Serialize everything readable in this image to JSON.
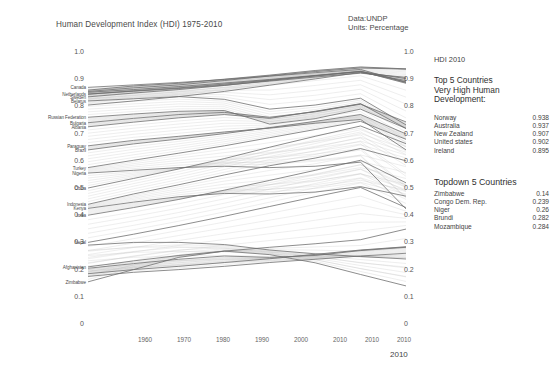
{
  "header": {
    "title": "Human Development Index (HDI) 1975-2010",
    "source_line1": "Data:UNDP",
    "source_line2": "Units: Percentage"
  },
  "legend": {
    "heading": "HDI 2010",
    "top_title_line1": "Top 5 Countries",
    "top_title_line2": "Very High Human",
    "top_title_line3": "Development:",
    "top_rows": [
      {
        "name": "Norway",
        "value": "0.938"
      },
      {
        "name": "Australia",
        "value": "0.937"
      },
      {
        "name": "New Zealand",
        "value": "0.907"
      },
      {
        "name": "United states",
        "value": "0.902"
      },
      {
        "name": "Ireland",
        "value": "0.895"
      }
    ],
    "bottom_title": "Topdown 5 Countries",
    "bottom_rows": [
      {
        "name": "Zimbabwe",
        "value": "0.14"
      },
      {
        "name": "Congo  Dem. Rep.",
        "value": "0.239"
      },
      {
        "name": "Niger",
        "value": "0.26"
      },
      {
        "name": "Brundi",
        "value": "0.282"
      },
      {
        "name": "Mozambique",
        "value": "0.284"
      }
    ]
  },
  "chart_data": {
    "type": "line",
    "title": "Human Development Index (HDI) 1975-2010",
    "xlabel": "",
    "ylabel": "",
    "ylim": [
      0,
      1.0
    ],
    "grid": false,
    "legend_position": "right",
    "y_ticks_left": [
      "1.0",
      "0.9",
      "0.8",
      "0.7",
      "0.6",
      "0.5",
      "0.4",
      "0.3",
      "0.2",
      "0.1",
      "0"
    ],
    "y_ticks_right": [
      "1.0",
      "0.9",
      "0.8",
      "0.7",
      "0.6",
      "0.5",
      "0.4",
      "0.3",
      "0.2",
      "0.1",
      "0"
    ],
    "x_ticks": [
      "1960",
      "1970",
      "1980",
      "1990",
      "2000",
      "2010",
      "2010",
      "2010"
    ],
    "x_axis_note": "2010",
    "x": [
      1975,
      1980,
      1985,
      1990,
      1995,
      2000,
      2005,
      2010
    ],
    "left_axis_labels": [
      {
        "name": "Canada",
        "value": 0.87
      },
      {
        "name": "Netherlands",
        "value": 0.845
      },
      {
        "name": "Sweden",
        "value": 0.835
      },
      {
        "name": "Belarus",
        "value": 0.82
      },
      {
        "name": "Russian Federation",
        "value": 0.76
      },
      {
        "name": "Bulgaria",
        "value": 0.74
      },
      {
        "name": "Albania",
        "value": 0.725
      },
      {
        "name": "Paraguay",
        "value": 0.655
      },
      {
        "name": "Brazil",
        "value": 0.64
      },
      {
        "name": "Turkey",
        "value": 0.575
      },
      {
        "name": "Nigeria",
        "value": 0.555
      },
      {
        "name": "China",
        "value": 0.5
      },
      {
        "name": "Indonesia",
        "value": 0.44
      },
      {
        "name": "Kenya",
        "value": 0.425
      },
      {
        "name": "India",
        "value": 0.4
      },
      {
        "name": "Nepal",
        "value": 0.3
      },
      {
        "name": "Afghanistan",
        "value": 0.21
      },
      {
        "name": "Zimbabwe",
        "value": 0.155
      }
    ],
    "series": [
      {
        "name": "Norway",
        "values": [
          0.86,
          0.875,
          0.885,
          0.9,
          0.915,
          0.932,
          0.945,
          0.938
        ]
      },
      {
        "name": "Australia",
        "values": [
          0.855,
          0.868,
          0.879,
          0.895,
          0.912,
          0.928,
          0.941,
          0.937
        ]
      },
      {
        "name": "New Zealand",
        "values": [
          0.845,
          0.856,
          0.866,
          0.878,
          0.893,
          0.908,
          0.922,
          0.907
        ]
      },
      {
        "name": "United states",
        "values": [
          0.852,
          0.862,
          0.873,
          0.886,
          0.899,
          0.914,
          0.928,
          0.902
        ]
      },
      {
        "name": "Ireland",
        "values": [
          0.805,
          0.82,
          0.836,
          0.855,
          0.878,
          0.901,
          0.925,
          0.895
        ]
      },
      {
        "name": "Canada",
        "values": [
          0.87,
          0.879,
          0.888,
          0.899,
          0.911,
          0.924,
          0.936,
          0.888
        ]
      },
      {
        "name": "Netherlands",
        "values": [
          0.845,
          0.857,
          0.868,
          0.882,
          0.897,
          0.912,
          0.928,
          0.89
        ]
      },
      {
        "name": "Sweden",
        "values": [
          0.835,
          0.849,
          0.862,
          0.877,
          0.895,
          0.913,
          0.929,
          0.885
        ]
      },
      {
        "name": "Belarus",
        "values": [
          0.82,
          0.828,
          0.836,
          0.826,
          0.79,
          0.805,
          0.83,
          0.732
        ]
      },
      {
        "name": "Russian Federation",
        "values": [
          0.76,
          0.772,
          0.782,
          0.785,
          0.735,
          0.755,
          0.79,
          0.719
        ]
      },
      {
        "name": "Bulgaria",
        "values": [
          0.74,
          0.756,
          0.77,
          0.778,
          0.76,
          0.78,
          0.808,
          0.743
        ]
      },
      {
        "name": "Albania",
        "values": [
          0.725,
          0.742,
          0.758,
          0.77,
          0.756,
          0.782,
          0.81,
          0.719
        ]
      },
      {
        "name": "Paraguay",
        "values": [
          0.655,
          0.675,
          0.69,
          0.706,
          0.72,
          0.738,
          0.752,
          0.64
        ]
      },
      {
        "name": "Brazil",
        "values": [
          0.64,
          0.662,
          0.68,
          0.7,
          0.722,
          0.745,
          0.77,
          0.699
        ]
      },
      {
        "name": "Turkey",
        "values": [
          0.575,
          0.602,
          0.628,
          0.655,
          0.685,
          0.715,
          0.745,
          0.679
        ]
      },
      {
        "name": "Nigeria",
        "values": [
          0.555,
          0.565,
          0.575,
          0.58,
          0.575,
          0.58,
          0.595,
          0.423
        ]
      },
      {
        "name": "China",
        "values": [
          0.5,
          0.535,
          0.57,
          0.608,
          0.65,
          0.69,
          0.728,
          0.663
        ]
      },
      {
        "name": "Indonesia",
        "values": [
          0.44,
          0.478,
          0.512,
          0.548,
          0.582,
          0.61,
          0.645,
          0.6
        ]
      },
      {
        "name": "Kenya",
        "values": [
          0.425,
          0.448,
          0.468,
          0.48,
          0.478,
          0.485,
          0.505,
          0.47
        ]
      },
      {
        "name": "India",
        "values": [
          0.4,
          0.428,
          0.458,
          0.492,
          0.528,
          0.565,
          0.602,
          0.519
        ]
      },
      {
        "name": "Nepal",
        "values": [
          0.3,
          0.33,
          0.362,
          0.396,
          0.432,
          0.468,
          0.502,
          0.428
        ]
      },
      {
        "name": "Afghanistan",
        "values": [
          0.21,
          0.232,
          0.252,
          0.268,
          0.282,
          0.295,
          0.31,
          0.349
        ]
      },
      {
        "name": "Zimbabwe",
        "values": [
          0.155,
          0.2,
          0.245,
          0.268,
          0.255,
          0.225,
          0.182,
          0.14
        ]
      },
      {
        "name": "Congo Dem. Rep.",
        "values": [
          0.29,
          0.3,
          0.3,
          0.292,
          0.272,
          0.258,
          0.248,
          0.239
        ]
      },
      {
        "name": "Niger",
        "values": [
          0.175,
          0.19,
          0.2,
          0.212,
          0.226,
          0.238,
          0.25,
          0.26
        ]
      },
      {
        "name": "Brundi",
        "values": [
          0.205,
          0.222,
          0.238,
          0.25,
          0.245,
          0.252,
          0.27,
          0.282
        ]
      },
      {
        "name": "Mozambique",
        "values": [
          0.185,
          0.2,
          0.212,
          0.226,
          0.24,
          0.256,
          0.272,
          0.284
        ]
      }
    ]
  }
}
